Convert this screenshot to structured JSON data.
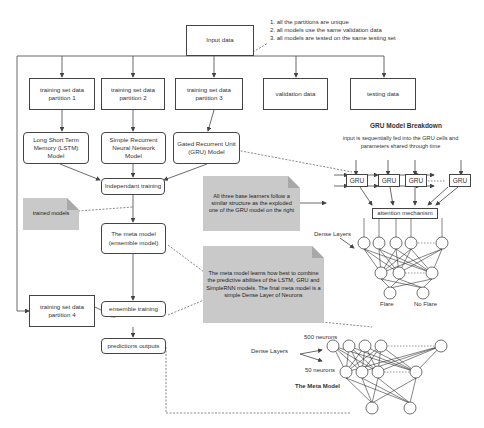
{
  "notes_list": [
    "1. all the partitions are unique",
    "2. all models use the same validation data",
    "3. all models are tested on the same testing set"
  ],
  "boxes": {
    "input": "Input data",
    "p1": "training set data partition 1",
    "p2": "training set data partition 2",
    "p3": "training set data partition 3",
    "validation": "validation data",
    "testing": "testing data",
    "lstm": "Long Short Term Memory (LSTM) Model",
    "srnn": "Simple Recurrent Neural Network Model",
    "gru": "Gated Recurrent Unit (GRU) Model",
    "independent": "Independant training",
    "meta": "The meta model (ensemble model)",
    "p4": "training set data partition 4",
    "ensemble": "ensemble training",
    "predictions": "predictions outputs"
  },
  "notes": {
    "trained": "trained models",
    "base": "All three base learners follow a similar structure as the exploded one of the GRU model on the right",
    "meta": "The meta model learns how  best to combine the predictive abilities of the LSTM, GRU and SimpleRNN models. The final meta model is a simple Dense Layer of Neurons"
  },
  "gru_breakdown": {
    "title": "GRU Model Breakdown",
    "subtitle": "input is sequentially fed into the GRU cells and parameters shared through time",
    "cells": [
      "GRU",
      "GRU",
      "GRU",
      "GRU"
    ],
    "attention": "attention mechanism",
    "dense_label": "Dense Layers",
    "outputs": [
      "Flare",
      "No Flare"
    ]
  },
  "meta_model": {
    "dense_label": "Dense Layers",
    "layer1": "500 neurons",
    "layer2": "50 neurons",
    "title": "The Meta Model"
  }
}
